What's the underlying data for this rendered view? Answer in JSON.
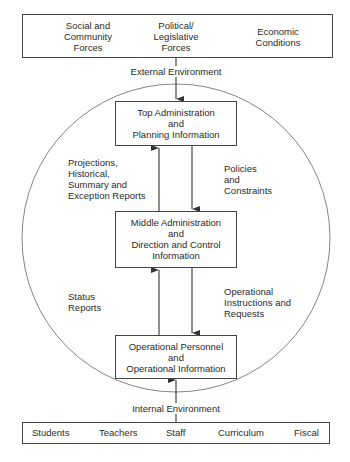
{
  "external": {
    "forces": [
      {
        "lines": [
          "Social and",
          "Community",
          "Forces"
        ]
      },
      {
        "lines": [
          "Political/",
          "Legislative",
          "Forces"
        ]
      },
      {
        "lines": [
          "Economic",
          "Conditions"
        ]
      }
    ],
    "label": "External Environment"
  },
  "levels": {
    "top": {
      "lines": [
        "Top Administration",
        "and",
        "Planning Information"
      ]
    },
    "middle": {
      "lines": [
        "Middle Administration",
        "and",
        "Direction and Control",
        "Information"
      ]
    },
    "bottom": {
      "lines": [
        "Operational Personnel",
        "and",
        "Operational Information"
      ]
    }
  },
  "flows": {
    "upper_up": {
      "lines": [
        "Projections,",
        "Historical,",
        "Summary and",
        "Exception Reports"
      ]
    },
    "upper_down": {
      "lines": [
        "Policies",
        "and",
        "Constraints"
      ]
    },
    "lower_up": {
      "lines": [
        "Status",
        "Reports"
      ]
    },
    "lower_down": {
      "lines": [
        "Operational",
        "Instructions and",
        "Requests"
      ]
    }
  },
  "internal": {
    "label": "Internal Environment",
    "items": [
      "Students",
      "Teachers",
      "Staff",
      "Curriculum",
      "Fiscal"
    ]
  },
  "colors": {
    "line": "#444444",
    "circle": "#666666",
    "text": "#2a2a2a"
  }
}
